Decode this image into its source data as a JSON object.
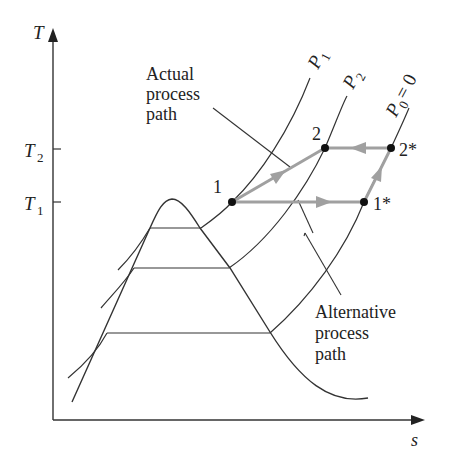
{
  "diagram": {
    "axes": {
      "y_label": "T",
      "x_label": "s",
      "y_ticks": [
        {
          "label": "T",
          "sub": "2"
        },
        {
          "label": "T",
          "sub": "1"
        }
      ]
    },
    "isobars": [
      {
        "label": "P",
        "sub": "1"
      },
      {
        "label": "P",
        "sub": "2"
      },
      {
        "label": "P",
        "sub": "0",
        "suffix": " = 0"
      }
    ],
    "points": [
      {
        "id": "1",
        "label": "1"
      },
      {
        "id": "2",
        "label": "2"
      },
      {
        "id": "2*",
        "label": "2*"
      },
      {
        "id": "1*",
        "label": "1*"
      }
    ],
    "annotations": {
      "actual": [
        "Actual",
        "process",
        "path"
      ],
      "alternative": [
        "Alternative",
        "process",
        "path"
      ]
    },
    "colors": {
      "line": "#2a2a2a",
      "process_path": "#a0a0a0",
      "point": "#111111"
    }
  }
}
